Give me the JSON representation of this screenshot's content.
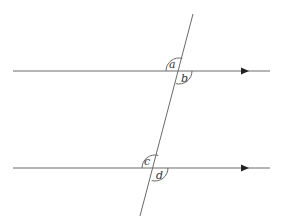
{
  "diagram": {
    "colors": {
      "line": "#6a6a6a",
      "arrow": "#222222",
      "label": "#333333",
      "background": "#ffffff"
    },
    "parallel_lines": [
      {
        "name": "top-line",
        "y": 71,
        "x_start": 13,
        "x_end": 270,
        "arrow_x": 246
      },
      {
        "name": "bottom-line",
        "y": 168,
        "x_start": 13,
        "x_end": 270,
        "arrow_x": 246
      }
    ],
    "transversal": {
      "x1": 193,
      "y1": 14,
      "x2": 140,
      "y2": 216
    },
    "angles": [
      {
        "label": "a",
        "position": "above-left",
        "intersection": "top"
      },
      {
        "label": "b",
        "position": "below-right",
        "intersection": "top"
      },
      {
        "label": "c",
        "position": "above-left",
        "intersection": "bottom"
      },
      {
        "label": "d",
        "position": "below-right",
        "intersection": "bottom"
      }
    ]
  }
}
